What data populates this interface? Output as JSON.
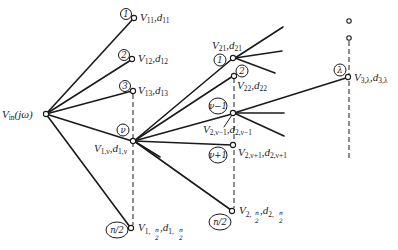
{
  "diagram": {
    "type": "tree-network",
    "root": {
      "id": "vin",
      "label_main": "V",
      "label_sub": "in",
      "label_tail": "(jω)"
    },
    "stage1": {
      "nodes": [
        {
          "id": "n11",
          "badge": "1",
          "v_main": "V",
          "v_sub": "11",
          "d_main": "d",
          "d_sub": "11"
        },
        {
          "id": "n12",
          "badge": "2",
          "v_main": "V",
          "v_sub": "12",
          "d_main": "d",
          "d_sub": "12"
        },
        {
          "id": "n13",
          "badge": "3",
          "v_main": "V",
          "v_sub": "13",
          "d_main": "d",
          "d_sub": "13"
        },
        {
          "id": "n1v",
          "badge": "ν",
          "v_main": "V",
          "v_sub": "1,ν",
          "d_main": "d",
          "d_sub": "1,ν"
        },
        {
          "id": "n1n2",
          "badge": "n/2",
          "v_main": "V",
          "v_sub": "1,",
          "v_frac_num": "n",
          "v_frac_den": "2",
          "d_main": "d",
          "d_sub": "1,",
          "d_frac_num": "n",
          "d_frac_den": "2"
        }
      ]
    },
    "stage2": {
      "nodes": [
        {
          "id": "n21",
          "badge": "1",
          "v_main": "V",
          "v_sub": "21",
          "d_main": "d",
          "d_sub": "21"
        },
        {
          "id": "n22",
          "badge": "2",
          "v_main": "V",
          "v_sub": "22",
          "d_main": "d",
          "d_sub": "22"
        },
        {
          "id": "n2vm1",
          "badge": "ν−1",
          "v_main": "V",
          "v_sub": "2,ν−1",
          "d_main": "d",
          "d_sub": "2,ν−1"
        },
        {
          "id": "n2vp1",
          "badge": "ν+1",
          "v_main": "V",
          "v_sub": "2,ν+1",
          "d_main": "d",
          "d_sub": "2,ν+1"
        },
        {
          "id": "n2n2",
          "badge": "n/2",
          "v_main": "V",
          "v_sub": "2,",
          "v_frac_num": "n",
          "v_frac_den": "2",
          "d_main": "d",
          "d_sub": "2,",
          "d_frac_num": "n",
          "d_frac_den": "2"
        }
      ]
    },
    "stage3": {
      "nodes": [
        {
          "id": "n3l",
          "badge": "λ",
          "v_main": "V",
          "v_sub": "3,λ",
          "d_main": "d",
          "d_sub": "3,λ"
        }
      ]
    },
    "separator": ","
  }
}
